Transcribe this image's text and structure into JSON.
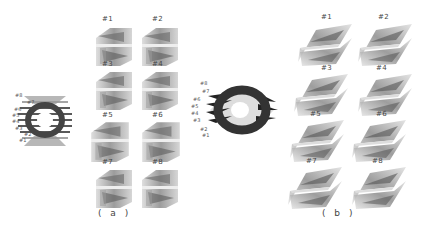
{
  "figure": {
    "panels": [
      {
        "caption": "( a )",
        "main_plot_labels": [
          "#8",
          "#7",
          "#6",
          "#5",
          "#4",
          "#3",
          "#2",
          "#1"
        ],
        "tiles": [
          {
            "label": "#1"
          },
          {
            "label": "#2"
          },
          {
            "label": "#3"
          },
          {
            "label": "#4"
          },
          {
            "label": "#5"
          },
          {
            "label": "#6"
          },
          {
            "label": "#7"
          },
          {
            "label": "#8"
          }
        ]
      },
      {
        "caption": "( b )",
        "main_plot_labels": [
          "#8",
          "#7",
          "#6",
          "#5",
          "#4",
          "#3",
          "#2",
          "#1"
        ],
        "tiles": [
          {
            "label": "#1"
          },
          {
            "label": "#2"
          },
          {
            "label": "#3"
          },
          {
            "label": "#4"
          },
          {
            "label": "#5"
          },
          {
            "label": "#6"
          },
          {
            "label": "#7"
          },
          {
            "label": "#8"
          }
        ]
      }
    ]
  }
}
